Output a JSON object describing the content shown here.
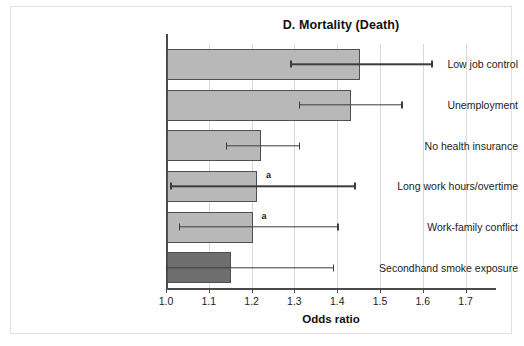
{
  "figure": {
    "title": "D. Mortality (Death)",
    "x_axis_title": "Odds ratio",
    "annotation_marker": "a",
    "colors": {
      "bar_light": "#b8b8b8",
      "bar_dark": "#6e6e6e",
      "bar_outline": "#4f4f4f",
      "error_bar": "#3d3d3d",
      "gridline": "#d9d9d9",
      "axis": "#4a4a4a",
      "frame_border": "#e2e2e2",
      "background": "#ffffff"
    }
  },
  "chart_data": {
    "type": "bar",
    "orientation": "horizontal",
    "title": "D. Mortality (Death)",
    "xlabel": "Odds ratio",
    "ylabel": "",
    "xlim": [
      1.0,
      1.78
    ],
    "grid": true,
    "legend": null,
    "xticks": [
      "1.0",
      "1.1",
      "1.2",
      "1.3",
      "1.4",
      "1.5",
      "1.6",
      "1.7"
    ],
    "xtick_values": [
      1.0,
      1.1,
      1.2,
      1.3,
      1.4,
      1.5,
      1.6,
      1.7
    ],
    "categories": [
      "Low job control",
      "Unemployment",
      "No health insurance",
      "Long work hours/overtime",
      "Work-family conflict",
      "Secondhand smoke exposure"
    ],
    "values": [
      1.45,
      1.43,
      1.22,
      1.21,
      1.2,
      1.15
    ],
    "ci_low": [
      1.29,
      1.31,
      1.14,
      1.01,
      1.03,
      1.0
    ],
    "ci_high": [
      1.62,
      1.55,
      1.31,
      1.44,
      1.4,
      1.39
    ],
    "annotations": [
      null,
      null,
      null,
      "a",
      "a",
      null
    ],
    "bar_colors": [
      "#b8b8b8",
      "#b8b8b8",
      "#b8b8b8",
      "#b8b8b8",
      "#b8b8b8",
      "#6e6e6e"
    ]
  }
}
